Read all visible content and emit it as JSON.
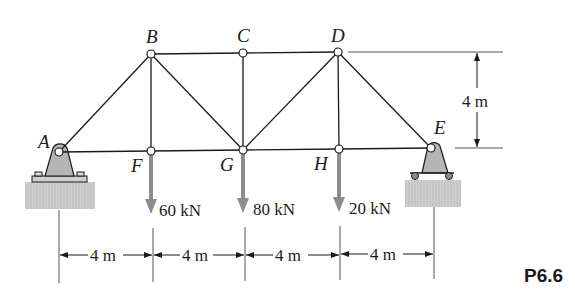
{
  "figure": {
    "label": "P6.6"
  },
  "joints": {
    "A": {
      "label": "A",
      "x": 59,
      "y": 152
    },
    "B": {
      "label": "B",
      "x": 151,
      "y": 54
    },
    "C": {
      "label": "C",
      "x": 243,
      "y": 53
    },
    "D": {
      "label": "D",
      "x": 338,
      "y": 52
    },
    "E": {
      "label": "E",
      "x": 431,
      "y": 148
    },
    "F": {
      "label": "F",
      "x": 151,
      "y": 151
    },
    "G": {
      "label": "G",
      "x": 243,
      "y": 150
    },
    "H": {
      "label": "H",
      "x": 339,
      "y": 149
    }
  },
  "members": [
    "AB",
    "AF",
    "BF",
    "BC",
    "BG",
    "CG",
    "CD",
    "DG",
    "DH",
    "DE",
    "FG",
    "GH",
    "HE"
  ],
  "loads": [
    {
      "joint": "F",
      "value": "60 kN"
    },
    {
      "joint": "G",
      "value": "80 kN"
    },
    {
      "joint": "H",
      "value": "20 kN"
    }
  ],
  "dimensions": {
    "spans": [
      "4 m",
      "4 m",
      "4 m",
      "4 m"
    ],
    "height": "4 m"
  },
  "supports": {
    "A": "pin",
    "E": "roller"
  },
  "colors": {
    "member": "#1a1a1a",
    "load_arrow": "#8c8c8c",
    "support_fill": "#b5b5b5",
    "ground_fill": "#c8c8c8"
  }
}
